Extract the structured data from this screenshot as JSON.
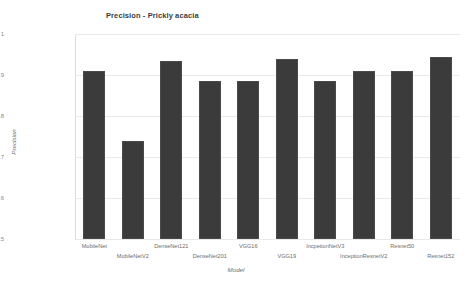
{
  "chart_data": {
    "type": "bar",
    "title": "Precision - Prickly acacia",
    "xlabel": "Model",
    "ylabel": "Precision",
    "categories": [
      "MobileNet",
      "MobileNetV2",
      "DenseNet121",
      "DenseNet201",
      "VGG16",
      "VGG19",
      "IncpetionNetV3",
      "InceptionResnetV2",
      "Resnet50",
      "Resnet152"
    ],
    "values": [
      0.91,
      0.74,
      0.935,
      0.885,
      0.885,
      0.94,
      0.885,
      0.91,
      0.91,
      0.945
    ],
    "ylim": [
      0.5,
      1.0
    ],
    "yticks": [
      "0.5",
      "0.6",
      "0.7",
      "0.8",
      "0.9",
      "1"
    ],
    "ytick_values": [
      0.5,
      0.6,
      0.7,
      0.8,
      0.9,
      1.0
    ],
    "grid": true,
    "legend": "none",
    "bar_color": "#3b3b3b",
    "grid_color": "#e9e9e9",
    "text_color": "#6d6d6d"
  }
}
